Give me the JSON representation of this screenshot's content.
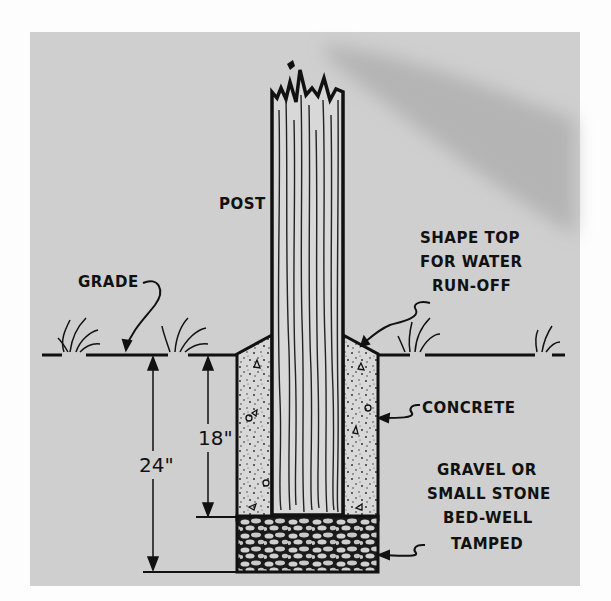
{
  "diagram": {
    "type": "cross-section",
    "labels": {
      "post": "POST",
      "grade": "GRADE",
      "shape_top": [
        "SHAPE TOP",
        "FOR WATER",
        "RUN-OFF"
      ],
      "concrete": "CONCRETE",
      "gravel": [
        "GRAVEL OR",
        "SMALL STONE",
        "BED-WELL",
        "TAMPED"
      ]
    },
    "dimensions": {
      "total_depth": "24\"",
      "post_depth": "18\""
    },
    "colors": {
      "background": "#cfcfcf",
      "ink": "#111111",
      "page": "#fdfdfd",
      "shadow": "#a9a9a9"
    }
  }
}
